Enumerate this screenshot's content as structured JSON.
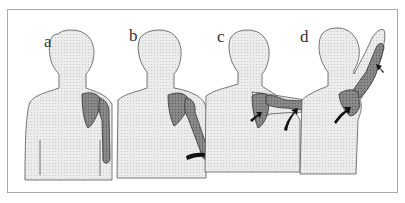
{
  "figure": {
    "panels": [
      {
        "label": "a"
      },
      {
        "label": "b"
      },
      {
        "label": "c"
      },
      {
        "label": "d"
      }
    ]
  },
  "colors": {
    "body_fill": "#e9e9e9",
    "outline": "#555555",
    "bone_fill": "#7a7a7a",
    "arrow": "#111111",
    "border": "#a8a8a8"
  }
}
